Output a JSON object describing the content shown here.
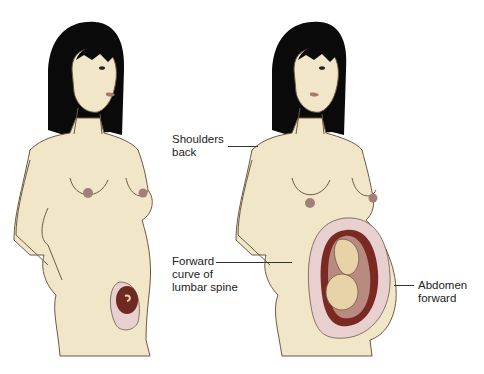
{
  "figures": [
    {
      "id": "early-pregnancy",
      "description": "Woman in early pregnancy, small embryo in uterus"
    },
    {
      "id": "late-pregnancy",
      "description": "Woman in late pregnancy, full-term fetus in uterus"
    }
  ],
  "labels": {
    "shoulders": "Shoulders\nback",
    "lumbar": "Forward\ncurve of\nlumbar spine",
    "abdomen": "Abdomen\nforward"
  },
  "colors": {
    "skin": "#f2e6c9",
    "outline": "#6b5a45",
    "hair": "#0a0a0a",
    "uterus_outer": "#e8cfd0",
    "uterus_inner": "#7a2a22",
    "fetus": "#e8d2a8"
  }
}
